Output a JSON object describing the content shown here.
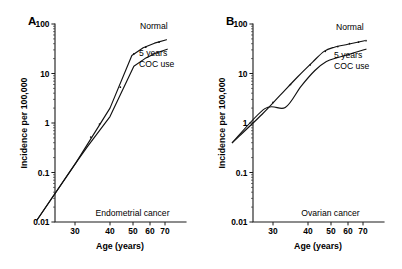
{
  "figure": {
    "background_color": "#ffffff",
    "ink_color": "#111111",
    "panels": [
      {
        "id": "A",
        "letter": "A",
        "caption": "Endometrial cancer",
        "x_axis": {
          "label": "Age (years)",
          "tick_labels": [
            "30",
            "40",
            "50",
            "60",
            "70"
          ],
          "tick_values": [
            30,
            40,
            50,
            60,
            70
          ],
          "tick_positions_px": [
            75,
            110,
            133,
            150,
            165
          ],
          "range": [
            22,
            74
          ]
        },
        "y_axis": {
          "label": "Incidence per 100,000",
          "scale": "log10",
          "tick_labels": [
            "100",
            "10",
            "1",
            "0.1",
            "0.01"
          ],
          "tick_values": [
            100,
            10,
            1,
            0.1,
            0.01
          ],
          "range": [
            0.01,
            100
          ]
        },
        "series": [
          {
            "name": "Normal",
            "label": "Normal",
            "label_position": {
              "x": 140,
              "y": 29
            },
            "points": [
              {
                "age": 23.0,
                "incidence": 0.011
              },
              {
                "age": 30.2,
                "incidence": 0.155
              },
              {
                "age": 40.0,
                "incidence": 2.0
              },
              {
                "age": 49.5,
                "incidence": 23.0
              },
              {
                "age": 56.0,
                "incidence": 33.0
              },
              {
                "age": 63.0,
                "incidence": 41.0
              },
              {
                "age": 71.0,
                "incidence": 48.0
              }
            ],
            "markers": [
              {
                "age": 34.5,
                "incidence": 0.52
              },
              {
                "age": 44.5,
                "incidence": 5.3
              },
              {
                "age": 50.5,
                "incidence": 25.0
              },
              {
                "age": 57.5,
                "incidence": 34.0
              },
              {
                "age": 66.0,
                "incidence": 43.0
              }
            ]
          },
          {
            "name": "5 years COC use",
            "label": "5 years\nCOC use",
            "label_line_1": "5 years",
            "label_line_2": "COC use",
            "label_position": {
              "x": 139,
              "y": 56
            },
            "points": [
              {
                "age": 23.0,
                "incidence": 0.011
              },
              {
                "age": 30.2,
                "incidence": 0.155
              },
              {
                "age": 33.5,
                "incidence": 0.33
              },
              {
                "age": 40.0,
                "incidence": 1.35
              },
              {
                "age": 50.5,
                "incidence": 14.0
              },
              {
                "age": 57.0,
                "incidence": 20.0
              },
              {
                "age": 64.0,
                "incidence": 26.0
              },
              {
                "age": 71.5,
                "incidence": 31.0
              }
            ],
            "markers": [
              {
                "age": 37.0,
                "incidence": 0.95
              }
            ]
          }
        ]
      },
      {
        "id": "B",
        "letter": "B",
        "caption": "Ovarian cancer",
        "x_axis": {
          "label": "Age (years)",
          "tick_labels": [
            "30",
            "40",
            "50",
            "60",
            "70"
          ],
          "tick_values": [
            30,
            40,
            50,
            60,
            70
          ],
          "tick_positions_px": [
            273,
            308,
            331,
            348,
            363
          ],
          "range": [
            22,
            74
          ]
        },
        "y_axis": {
          "label": "Incidence per 100,000",
          "scale": "log10",
          "tick_labels": [
            "100",
            "10",
            "1",
            "0.1",
            "0.01"
          ],
          "tick_values": [
            100,
            10,
            1,
            0.1,
            0.01
          ],
          "range": [
            0.01,
            100
          ]
        },
        "series": [
          {
            "name": "Normal",
            "label": "Normal",
            "label_position": {
              "x": 336,
              "y": 30
            },
            "points": [
              {
                "age": 22.5,
                "incidence": 0.4
              },
              {
                "age": 28.0,
                "incidence": 1.5
              },
              {
                "age": 32.0,
                "incidence": 3.6
              },
              {
                "age": 37.0,
                "incidence": 8.5
              },
              {
                "age": 42.0,
                "incidence": 17.0
              },
              {
                "age": 47.0,
                "incidence": 28.0
              },
              {
                "age": 52.0,
                "incidence": 34.0
              },
              {
                "age": 60.0,
                "incidence": 39.0
              },
              {
                "age": 71.0,
                "incidence": 46.0
              }
            ],
            "markers": [
              {
                "age": 30.0,
                "incidence": 2.6
              },
              {
                "age": 35.0,
                "incidence": 6.0
              },
              {
                "age": 41.0,
                "incidence": 15.0
              },
              {
                "age": 47.5,
                "incidence": 28.0
              },
              {
                "age": 54.0,
                "incidence": 35.0
              },
              {
                "age": 61.0,
                "incidence": 40.0
              },
              {
                "age": 67.0,
                "incidence": 43.0
              },
              {
                "age": 72.0,
                "incidence": 46.0
              }
            ]
          },
          {
            "name": "5 years COC use",
            "label": "5 years\nCOC use",
            "label_line_1": "5 years",
            "label_line_2": "COC use",
            "label_position": {
              "x": 334,
              "y": 58
            },
            "points": [
              {
                "age": 22.5,
                "incidence": 0.4
              },
              {
                "age": 28.5,
                "incidence": 1.95
              },
              {
                "age": 33.5,
                "incidence": 2.05
              },
              {
                "age": 38.0,
                "incidence": 5.5
              },
              {
                "age": 43.0,
                "incidence": 11.5
              },
              {
                "age": 48.0,
                "incidence": 17.5
              },
              {
                "age": 54.0,
                "incidence": 21.0
              },
              {
                "age": 62.0,
                "incidence": 25.0
              },
              {
                "age": 72.0,
                "incidence": 31.0
              }
            ],
            "markers": []
          }
        ]
      }
    ]
  }
}
